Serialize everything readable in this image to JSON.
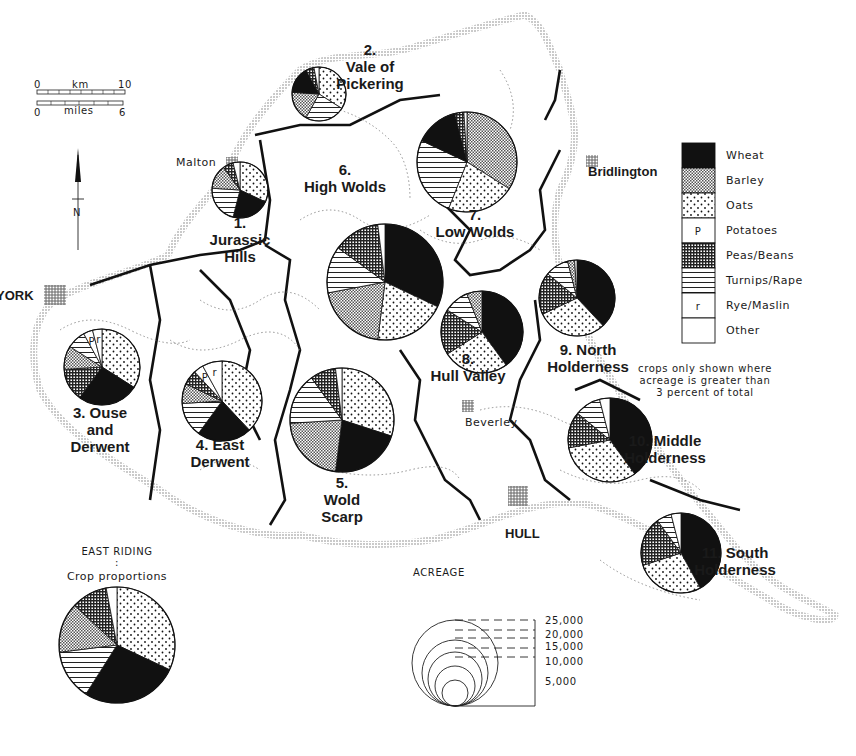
{
  "map": {
    "title": "AGRICULTURAL LAND USE",
    "scale_bar": {
      "km_start": "0",
      "km_label": "km",
      "km_end": "10",
      "mi_start": "0",
      "mi_label": "miles",
      "mi_end": "6"
    },
    "north_arrow": {
      "label": "N"
    },
    "towns": [
      {
        "name": "Malton",
        "x": 176,
        "y": 163
      },
      {
        "name": "Bridlington",
        "x": 588,
        "y": 174
      },
      {
        "name": "YORK",
        "x": 0,
        "y": 297
      },
      {
        "name": "Beverley",
        "x": 470,
        "y": 426
      },
      {
        "name": "HULL",
        "x": 511,
        "y": 533
      }
    ],
    "note": [
      "crops only shown where",
      "acreage is greater than",
      "3 percent of total"
    ],
    "east_riding": {
      "title": "EAST RIDING",
      "colon": ":",
      "subtitle": "Crop proportions"
    },
    "acreage_legend": {
      "title": "ACREAGE",
      "values": [
        "25,000",
        "20,000",
        "15,000",
        "10,000",
        "5,000"
      ]
    }
  },
  "legend": {
    "items": [
      {
        "key": "wheat",
        "label": "Wheat"
      },
      {
        "key": "barley",
        "label": "Barley"
      },
      {
        "key": "oats",
        "label": "Oats"
      },
      {
        "key": "potatoes",
        "label": "Potatoes",
        "symbol": "P"
      },
      {
        "key": "peas",
        "label": "Peas/Beans"
      },
      {
        "key": "turnips",
        "label": "Turnips/Rape"
      },
      {
        "key": "rye",
        "label": "Rye/Maslin",
        "symbol": "r"
      },
      {
        "key": "other",
        "label": "Other"
      }
    ]
  },
  "chart_data": {
    "type": "pie",
    "legend_position": "right",
    "categories": [
      "Wheat",
      "Barley",
      "Oats",
      "Potatoes",
      "Peas/Beans",
      "Turnips/Rape",
      "Rye/Maslin",
      "Other"
    ],
    "series": [
      {
        "id": 1,
        "name": "Jurassic Hills",
        "label_num": "1.",
        "label_lines": [
          "Jurassic",
          "Hills"
        ],
        "cx": 240,
        "cy": 190,
        "r": 28,
        "slices": [
          [
            "oats",
            32
          ],
          [
            "wheat",
            22
          ],
          [
            "turnips",
            22
          ],
          [
            "barley",
            14
          ],
          [
            "peas",
            6
          ],
          [
            "other",
            4
          ]
        ]
      },
      {
        "id": 2,
        "name": "Vale of Pickering",
        "label_num": "2.",
        "label_lines": [
          "Vale of",
          "Pickering"
        ],
        "cx": 319,
        "cy": 94,
        "r": 27,
        "slices": [
          [
            "oats",
            34
          ],
          [
            "turnips",
            24
          ],
          [
            "barley",
            18
          ],
          [
            "wheat",
            16
          ],
          [
            "peas",
            5
          ],
          [
            "other",
            3
          ]
        ]
      },
      {
        "id": 3,
        "name": "Ouse and Derwent",
        "label_num": "3.",
        "label_lines": [
          "3. Ouse",
          "and",
          "Derwent"
        ],
        "cx": 102,
        "cy": 367,
        "r": 38,
        "slices": [
          [
            "oats",
            34
          ],
          [
            "wheat",
            26
          ],
          [
            "peas",
            14
          ],
          [
            "barley",
            10
          ],
          [
            "turnips",
            8
          ],
          [
            "potatoes",
            4
          ],
          [
            "rye",
            4
          ]
        ]
      },
      {
        "id": 4,
        "name": "East Derwent",
        "label_num": "4.",
        "label_lines": [
          "4.  East",
          "Derwent"
        ],
        "cx": 222,
        "cy": 401,
        "r": 40,
        "slices": [
          [
            "oats",
            38
          ],
          [
            "wheat",
            22
          ],
          [
            "turnips",
            14
          ],
          [
            "barley",
            8
          ],
          [
            "peas",
            6
          ],
          [
            "potatoes",
            4
          ],
          [
            "rye",
            8
          ]
        ]
      },
      {
        "id": 5,
        "name": "Wold Scarp",
        "label_num": "5.",
        "label_lines": [
          "5.",
          "Wold",
          "Scarp"
        ],
        "cx": 342,
        "cy": 420,
        "r": 52,
        "slices": [
          [
            "oats",
            30
          ],
          [
            "wheat",
            22
          ],
          [
            "barley",
            22
          ],
          [
            "turnips",
            16
          ],
          [
            "peas",
            8
          ],
          [
            "other",
            2
          ]
        ]
      },
      {
        "id": 6,
        "name": "High Wolds",
        "label_num": "6.",
        "label_lines": [
          "6.",
          "High Wolds"
        ],
        "cx": 467,
        "cy": 162,
        "r": 50,
        "slices": [
          [
            "barley",
            34
          ],
          [
            "oats",
            22
          ],
          [
            "turnips",
            26
          ],
          [
            "wheat",
            14
          ],
          [
            "peas",
            3
          ],
          [
            "other",
            1
          ]
        ]
      },
      {
        "id": 7,
        "name": "Low Wolds",
        "label_num": "7.",
        "label_lines": [
          "7.",
          "Low Wolds"
        ],
        "cx": 385,
        "cy": 282,
        "r": 58,
        "slices": [
          [
            "wheat",
            32
          ],
          [
            "oats",
            20
          ],
          [
            "barley",
            20
          ],
          [
            "turnips",
            13
          ],
          [
            "peas",
            13
          ],
          [
            "other",
            2
          ]
        ]
      },
      {
        "id": 8,
        "name": "Hull Valley",
        "label_num": "8.",
        "label_lines": [
          "8.",
          "Hull Valley"
        ],
        "cx": 482,
        "cy": 332,
        "r": 41,
        "slices": [
          [
            "wheat",
            40
          ],
          [
            "oats",
            26
          ],
          [
            "peas",
            18
          ],
          [
            "turnips",
            10
          ],
          [
            "barley",
            6
          ]
        ]
      },
      {
        "id": 9,
        "name": "North Holderness",
        "label_num": "9.",
        "label_lines": [
          "9.  North",
          "Holderness"
        ],
        "cx": 577,
        "cy": 298,
        "r": 38,
        "slices": [
          [
            "wheat",
            38
          ],
          [
            "oats",
            30
          ],
          [
            "peas",
            18
          ],
          [
            "turnips",
            10
          ],
          [
            "barley",
            3
          ],
          [
            "other",
            1
          ]
        ]
      },
      {
        "id": 10,
        "name": "Middle Holderness",
        "label_num": "10.",
        "label_lines": [
          "10.  Middle",
          "Holderness"
        ],
        "cx": 610,
        "cy": 440,
        "r": 42,
        "slices": [
          [
            "wheat",
            40
          ],
          [
            "oats",
            32
          ],
          [
            "peas",
            14
          ],
          [
            "turnips",
            10
          ],
          [
            "other",
            4
          ]
        ]
      },
      {
        "id": 11,
        "name": "South Holderness",
        "label_num": "11.",
        "label_lines": [
          "11.  South",
          "Holderness"
        ],
        "cx": 681,
        "cy": 553,
        "r": 40,
        "slices": [
          [
            "wheat",
            42
          ],
          [
            "oats",
            28
          ],
          [
            "peas",
            20
          ],
          [
            "turnips",
            6
          ],
          [
            "other",
            4
          ]
        ]
      },
      {
        "id": 0,
        "name": "East Riding (total)",
        "label_num": "",
        "label_lines": [],
        "cx": 117,
        "cy": 645,
        "r": 58,
        "slices": [
          [
            "oats",
            32
          ],
          [
            "wheat",
            27
          ],
          [
            "turnips",
            14
          ],
          [
            "barley",
            14
          ],
          [
            "peas",
            10
          ],
          [
            "other",
            3
          ]
        ]
      }
    ]
  }
}
